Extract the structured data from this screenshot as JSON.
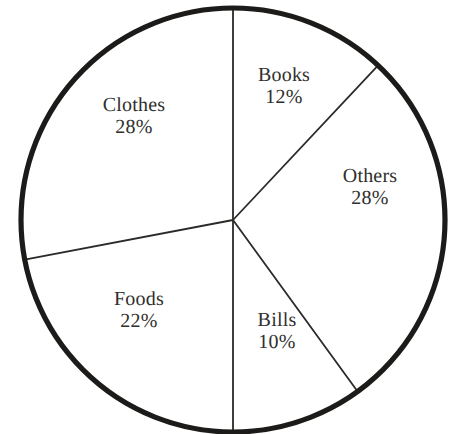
{
  "chart_data": {
    "type": "pie",
    "title": "",
    "subtitle": "",
    "xlabel": "",
    "ylabel": "",
    "legend": "none",
    "grid": false,
    "units": "percent",
    "total": 100,
    "start_angle_deg": 0,
    "direction": "clockwise",
    "categories": [
      "Books",
      "Others",
      "Bills",
      "Foods",
      "Clothes"
    ],
    "values": [
      12,
      28,
      10,
      22,
      28
    ],
    "slices": [
      {
        "name": "Books",
        "value": 12,
        "value_label": "12%",
        "start_deg": 0,
        "end_deg": 43.2,
        "fill": "#ffffff",
        "label_color": "#302f2d"
      },
      {
        "name": "Others",
        "value": 28,
        "value_label": "28%",
        "start_deg": 43.2,
        "end_deg": 144,
        "fill": "#ffffff",
        "label_color": "#302f2d"
      },
      {
        "name": "Bills",
        "value": 10,
        "value_label": "10%",
        "start_deg": 144,
        "end_deg": 180,
        "fill": "#ffffff",
        "label_color": "#302f2d"
      },
      {
        "name": "Foods",
        "value": 22,
        "value_label": "22%",
        "start_deg": 180,
        "end_deg": 259.2,
        "fill": "#ffffff",
        "label_color": "#302f2d"
      },
      {
        "name": "Clothes",
        "value": 28,
        "value_label": "28%",
        "start_deg": 259.2,
        "end_deg": 360,
        "fill": "#ffffff",
        "label_color": "#302f2d"
      }
    ]
  },
  "style": {
    "background": "#ffffff",
    "outline_color": "#1c1b19",
    "divider_color": "#2b2a28",
    "text_color": "#302f2d"
  }
}
